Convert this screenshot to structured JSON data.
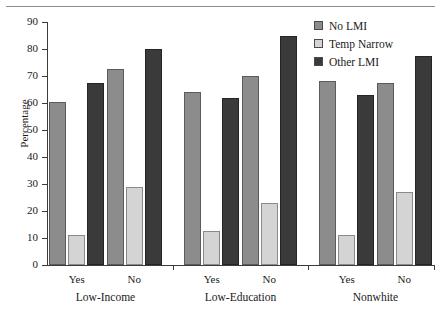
{
  "chart_data": {
    "type": "bar",
    "title": "",
    "xlabel": "",
    "ylabel": "Percentage",
    "ylim": [
      0,
      90
    ],
    "yticks": [
      0,
      10,
      20,
      30,
      40,
      50,
      60,
      70,
      80,
      90
    ],
    "grid": false,
    "legend_position": "top-right",
    "groups": [
      {
        "name": "Low-Income",
        "categories": [
          "Yes",
          "No"
        ]
      },
      {
        "name": "Low-Education",
        "categories": [
          "Yes",
          "No"
        ]
      },
      {
        "name": "Nonwhite",
        "categories": [
          "Yes",
          "No"
        ]
      }
    ],
    "categories": [
      "Low-Income Yes",
      "Low-Income No",
      "Low-Education Yes",
      "Low-Education No",
      "Nonwhite Yes",
      "Nonwhite No"
    ],
    "series": [
      {
        "name": "No LMI",
        "color": "#8c8c8c",
        "values": [
          60.5,
          72.5,
          64.0,
          70.0,
          68.0,
          67.5
        ]
      },
      {
        "name": "Temp Narrow",
        "color": "#d4d4d4",
        "values": [
          11.0,
          29.0,
          12.5,
          23.0,
          11.0,
          27.0
        ]
      },
      {
        "name": "Other LMI",
        "color": "#3a3a3a",
        "values": [
          67.5,
          80.0,
          62.0,
          85.0,
          63.0,
          77.5
        ]
      }
    ]
  },
  "legend": {
    "items": [
      {
        "label": "No LMI",
        "color": "#8c8c8c"
      },
      {
        "label": "Temp Narrow",
        "color": "#d4d4d4"
      },
      {
        "label": "Other LMI",
        "color": "#3a3a3a"
      }
    ]
  },
  "axis": {
    "y_label": "Percentage",
    "y_ticks": [
      "90",
      "80",
      "70",
      "60",
      "50",
      "40",
      "30",
      "20",
      "10",
      "0"
    ]
  },
  "x_axis": {
    "category_labels": [
      "Yes",
      "No",
      "Yes",
      "No",
      "Yes",
      "No"
    ],
    "group_labels": [
      "Low-Income",
      "Low-Education",
      "Nonwhite"
    ]
  }
}
